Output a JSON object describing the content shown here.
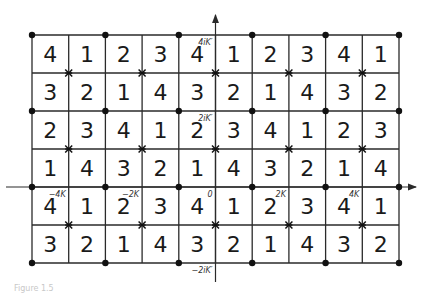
{
  "diagram": {
    "type": "period-parallelogram lattice",
    "rows": 6,
    "cols": 10,
    "grid": [
      [
        4,
        1,
        2,
        3,
        4,
        1,
        2,
        3,
        4,
        1
      ],
      [
        3,
        2,
        1,
        4,
        3,
        2,
        1,
        4,
        3,
        2
      ],
      [
        2,
        3,
        4,
        1,
        2,
        3,
        4,
        1,
        2,
        3
      ],
      [
        1,
        4,
        3,
        2,
        1,
        4,
        3,
        2,
        1,
        4
      ],
      [
        4,
        1,
        2,
        3,
        4,
        1,
        2,
        3,
        4,
        1
      ],
      [
        3,
        2,
        1,
        4,
        3,
        2,
        1,
        4,
        3,
        2
      ]
    ],
    "markers": {
      "dot": "even row line & even column line intersections",
      "star": "odd row line & odd column line intersections"
    },
    "axis_labels": {
      "real": [
        {
          "text": "−4K",
          "row": 4,
          "col": 0
        },
        {
          "text": "−2K",
          "row": 4,
          "col": 2
        },
        {
          "text": "0",
          "row": 4,
          "col": 4
        },
        {
          "text": "2K",
          "row": 4,
          "col": 6
        },
        {
          "text": "4K",
          "row": 4,
          "col": 8
        }
      ],
      "imag": [
        {
          "text": "4iK′",
          "row": 0,
          "col": 4
        },
        {
          "text": "2iK′",
          "row": 2,
          "col": 4
        },
        {
          "text": "−2iK′",
          "row": 6,
          "col": 4
        }
      ]
    },
    "colors": {
      "line": "#2a2a2a",
      "text": "#1a1a1a",
      "background": "#ffffff"
    }
  },
  "footer": {
    "ghost_text": "Figure 1.5"
  }
}
